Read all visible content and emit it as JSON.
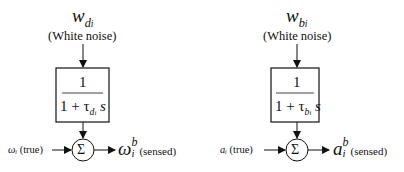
{
  "left": {
    "noise_symbol": "w",
    "noise_sub": "d",
    "noise_subsub": "i",
    "noise_label": "(White noise)",
    "tf_numerator": "1",
    "tf_denominator_prefix": "1 + τ",
    "tf_denominator_sub": "d",
    "tf_denominator_subsub": "i",
    "tf_denominator_suffix": " s",
    "sum_symbol": "Σ",
    "input_symbol": "ωᵢ",
    "input_label": "(true)",
    "output_symbol": "ω",
    "output_sup": "b",
    "output_sub": "i",
    "output_label": "(sensed)"
  },
  "right": {
    "noise_symbol": "w",
    "noise_sub": "b",
    "noise_subsub": "i",
    "noise_label": "(White noise)",
    "tf_numerator": "1",
    "tf_denominator_prefix": "1 + τ",
    "tf_denominator_sub": "b",
    "tf_denominator_subsub": "i",
    "tf_denominator_suffix": " s",
    "sum_symbol": "Σ",
    "input_symbol": "aᵢ",
    "input_label": "(true)",
    "output_symbol": "a",
    "output_sup": "b",
    "output_sub": "i",
    "output_label": "(sensed)"
  }
}
